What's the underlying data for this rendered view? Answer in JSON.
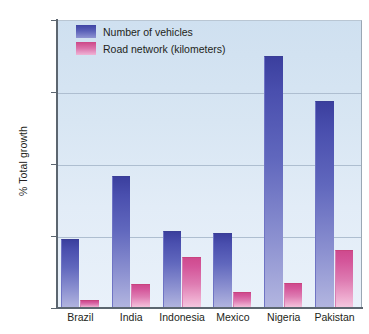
{
  "chart_data": {
    "type": "bar",
    "title": "",
    "xlabel": "",
    "ylabel": "% Total growth",
    "ylim": [
      0,
      800
    ],
    "yticks": [
      0,
      200,
      400,
      600,
      800
    ],
    "ytick_labels": [
      "0",
      "200",
      "400",
      "600",
      "800"
    ],
    "grid": true,
    "legend_position": "top-left",
    "categories": [
      "Brazil",
      "India",
      "Indonesia",
      "Mexico",
      "Nigeria",
      "Pakistan"
    ],
    "series": [
      {
        "name": "Number of vehicles",
        "color": "#4348a8",
        "values": [
          193,
          367,
          215,
          209,
          700,
          574
        ]
      },
      {
        "name": "Road network (kilometers)",
        "color": "#d4589b",
        "values": [
          22,
          67,
          142,
          45,
          70,
          162
        ]
      }
    ]
  },
  "axis": {
    "y_title": "% Total growth"
  },
  "legend": {
    "items": [
      {
        "label": "Number of vehicles",
        "swatch": "vehicles"
      },
      {
        "label": "Road network (kilometers)",
        "swatch": "roads"
      }
    ]
  }
}
